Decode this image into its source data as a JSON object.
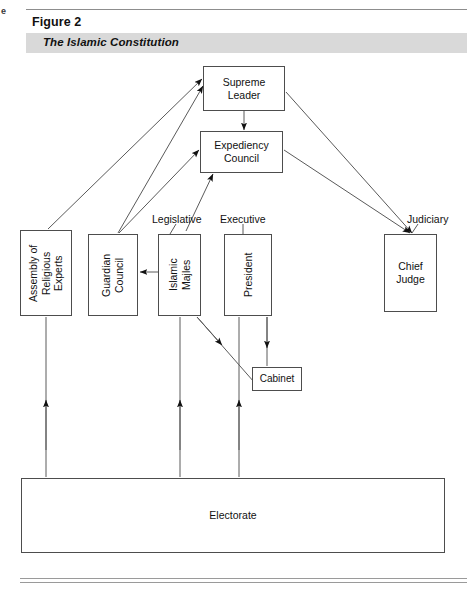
{
  "page": {
    "edge_mark": "e"
  },
  "header": {
    "figure_number": "Figure 2",
    "figure_title": "The Islamic Constitution"
  },
  "diagram": {
    "type": "organizational-flow-chart",
    "nodes": [
      {
        "id": "supreme-leader",
        "label": "Supreme\nLeader",
        "orientation": "horizontal"
      },
      {
        "id": "expediency",
        "label": "Expediency\nCouncil",
        "orientation": "horizontal"
      },
      {
        "id": "assembly",
        "label": "Assembly of\nReligious\nExperts",
        "orientation": "vertical"
      },
      {
        "id": "guardian",
        "label": "Guardian\nCouncil",
        "orientation": "vertical"
      },
      {
        "id": "majles",
        "label": "Islamic\nMajles",
        "orientation": "vertical"
      },
      {
        "id": "president",
        "label": "President",
        "orientation": "vertical"
      },
      {
        "id": "chief-judge",
        "label": "Chief\nJudge",
        "orientation": "horizontal"
      },
      {
        "id": "cabinet",
        "label": "Cabinet",
        "orientation": "horizontal"
      },
      {
        "id": "electorate",
        "label": "Electorate",
        "orientation": "horizontal"
      }
    ],
    "branch_captions": [
      {
        "id": "legislative",
        "label": "Legislative"
      },
      {
        "id": "executive",
        "label": "Executive"
      },
      {
        "id": "judiciary",
        "label": "Judiciary"
      }
    ],
    "edges": [
      {
        "from": "supreme-leader",
        "to": "expediency",
        "direction": "down"
      },
      {
        "from": "assembly",
        "to": "supreme-leader",
        "direction": "up-right"
      },
      {
        "from": "guardian",
        "to": "supreme-leader",
        "direction": "up-right"
      },
      {
        "from": "guardian",
        "to": "expediency",
        "direction": "up-right"
      },
      {
        "from": "majles",
        "to": "expediency",
        "direction": "up-right"
      },
      {
        "from": "supreme-leader",
        "to": "chief-judge",
        "direction": "down-right"
      },
      {
        "from": "expediency",
        "to": "chief-judge",
        "direction": "down-right"
      },
      {
        "from": "majles",
        "to": "guardian",
        "direction": "left"
      },
      {
        "from": "president",
        "to": "cabinet",
        "direction": "down"
      },
      {
        "from": "majles",
        "to": "cabinet",
        "direction": "down-right"
      },
      {
        "from": "electorate",
        "to": "assembly",
        "direction": "up"
      },
      {
        "from": "electorate",
        "to": "majles",
        "direction": "up"
      },
      {
        "from": "electorate",
        "to": "president",
        "direction": "up"
      }
    ],
    "colors": {
      "box_stroke": "#4d4d4d",
      "line": "#5a5a5a",
      "arrow_fill": "#111111",
      "title_bar": "#d9d9d9",
      "background": "#ffffff"
    }
  }
}
